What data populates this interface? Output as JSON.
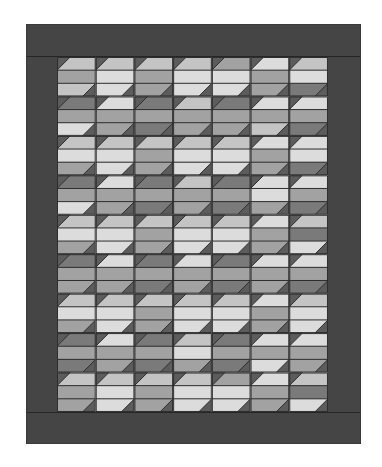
{
  "colors": {
    "border": "#454545",
    "seam": "#2e2e2e",
    "triangle": "#5c5c5c",
    "D": "#7a7a7a",
    "M": "#a2a2a2",
    "L": "#c4c4c4",
    "W": "#dcdcdc"
  },
  "grid": {
    "columns": 7,
    "rows": 9,
    "block_width": 38.71,
    "block_height": 39.44,
    "strips_per_block": 3
  },
  "blocks": [
    [
      [
        "L",
        "M",
        "L"
      ],
      [
        "L",
        "W",
        "W"
      ],
      [
        "L",
        "M",
        "M"
      ],
      [
        "L",
        "W",
        "W"
      ],
      [
        "M",
        "W",
        "W"
      ],
      [
        "W",
        "M",
        "M"
      ],
      [
        "L",
        "W",
        "D"
      ]
    ],
    [
      [
        "D",
        "M",
        "W"
      ],
      [
        "W",
        "M",
        "M"
      ],
      [
        "D",
        "M",
        "D"
      ],
      [
        "L",
        "M",
        "M"
      ],
      [
        "D",
        "M",
        "M"
      ],
      [
        "W",
        "M",
        "L"
      ],
      [
        "W",
        "M",
        "D"
      ]
    ],
    [
      [
        "L",
        "W",
        "M"
      ],
      [
        "L",
        "W",
        "W"
      ],
      [
        "L",
        "M",
        "M"
      ],
      [
        "L",
        "W",
        "W"
      ],
      [
        "L",
        "W",
        "W"
      ],
      [
        "W",
        "M",
        "M"
      ],
      [
        "W",
        "W",
        "D"
      ]
    ],
    [
      [
        "D",
        "M",
        "W"
      ],
      [
        "W",
        "M",
        "M"
      ],
      [
        "D",
        "M",
        "D"
      ],
      [
        "L",
        "M",
        "M"
      ],
      [
        "D",
        "M",
        "D"
      ],
      [
        "W",
        "W",
        "M"
      ],
      [
        "W",
        "M",
        "D"
      ]
    ],
    [
      [
        "L",
        "W",
        "M"
      ],
      [
        "L",
        "W",
        "W"
      ],
      [
        "L",
        "M",
        "M"
      ],
      [
        "L",
        "W",
        "W"
      ],
      [
        "L",
        "W",
        "W"
      ],
      [
        "W",
        "M",
        "M"
      ],
      [
        "L",
        "D",
        "W"
      ]
    ],
    [
      [
        "D",
        "M",
        "M"
      ],
      [
        "W",
        "M",
        "M"
      ],
      [
        "D",
        "M",
        "D"
      ],
      [
        "W",
        "M",
        "M"
      ],
      [
        "D",
        "M",
        "D"
      ],
      [
        "W",
        "M",
        "M"
      ],
      [
        "W",
        "M",
        "D"
      ]
    ],
    [
      [
        "L",
        "W",
        "M"
      ],
      [
        "L",
        "W",
        "W"
      ],
      [
        "L",
        "M",
        "M"
      ],
      [
        "L",
        "W",
        "W"
      ],
      [
        "L",
        "W",
        "W"
      ],
      [
        "W",
        "M",
        "M"
      ],
      [
        "L",
        "W",
        "W"
      ]
    ],
    [
      [
        "D",
        "M",
        "D"
      ],
      [
        "W",
        "M",
        "M"
      ],
      [
        "D",
        "M",
        "D"
      ],
      [
        "L",
        "W",
        "M"
      ],
      [
        "D",
        "M",
        "D"
      ],
      [
        "W",
        "M",
        "W"
      ],
      [
        "W",
        "M",
        "M"
      ]
    ],
    [
      [
        "L",
        "M",
        "M"
      ],
      [
        "L",
        "W",
        "W"
      ],
      [
        "L",
        "M",
        "M"
      ],
      [
        "L",
        "W",
        "W"
      ],
      [
        "M",
        "W",
        "W"
      ],
      [
        "W",
        "M",
        "M"
      ],
      [
        "L",
        "D",
        "W"
      ]
    ]
  ]
}
